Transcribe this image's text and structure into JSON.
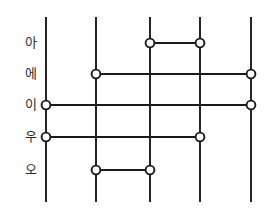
{
  "diagram": {
    "type": "ladder",
    "background_color": "#ffffff",
    "line_color": "#1a1a1a",
    "node_fill_color": "#ffffff",
    "label_color": "#2b2b2b",
    "vertical_lines": [
      {
        "id": "line-1",
        "x": 46,
        "y_top": 17,
        "y_bottom": 202
      },
      {
        "id": "line-2",
        "x": 96,
        "y_top": 17,
        "y_bottom": 202
      },
      {
        "id": "line-3",
        "x": 150,
        "y_top": 17,
        "y_bottom": 202
      },
      {
        "id": "line-4",
        "x": 200,
        "y_top": 17,
        "y_bottom": 202
      },
      {
        "id": "line-5",
        "x": 251,
        "y_top": 17,
        "y_bottom": 202
      }
    ],
    "rows": [
      {
        "label": "아",
        "label_x": 18,
        "y": 43,
        "from_x": 150,
        "to_x": 200
      },
      {
        "label": "에",
        "label_x": 18,
        "y": 74,
        "from_x": 96,
        "to_x": 251
      },
      {
        "label": "이",
        "label_x": 18,
        "y": 105,
        "from_x": 46,
        "to_x": 251
      },
      {
        "label": "우",
        "label_x": 18,
        "y": 137,
        "from_x": 46,
        "to_x": 200
      },
      {
        "label": "오",
        "label_x": 18,
        "y": 170,
        "from_x": 96,
        "to_x": 150
      }
    ],
    "node_radius": 4.4
  }
}
